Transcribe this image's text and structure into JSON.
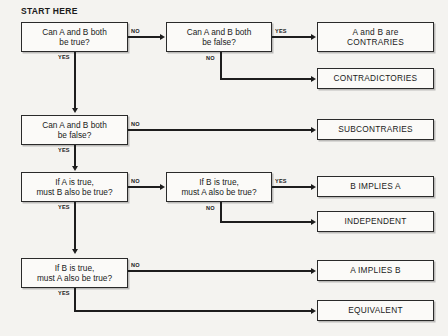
{
  "diagram": {
    "title_label": "START HERE",
    "nodes": [
      {
        "id": "q1",
        "kind": "decision",
        "lines": [
          "Can A and B both",
          "be true?"
        ]
      },
      {
        "id": "q2",
        "kind": "decision",
        "lines": [
          "Can A and B both",
          "be false?"
        ]
      },
      {
        "id": "r1",
        "kind": "result",
        "lines": [
          "A and B are",
          "CONTRARIES"
        ]
      },
      {
        "id": "r2",
        "kind": "result",
        "lines": [
          "CONTRADICTORIES"
        ]
      },
      {
        "id": "q3",
        "kind": "decision",
        "lines": [
          "Can A and B both",
          "be false?"
        ]
      },
      {
        "id": "r3",
        "kind": "result",
        "lines": [
          "SUBCONTRARIES"
        ]
      },
      {
        "id": "q4",
        "kind": "decision",
        "lines": [
          "If A is true,",
          "must B also be true?"
        ]
      },
      {
        "id": "q5",
        "kind": "decision",
        "lines": [
          "If B is true,",
          "must A also be true?"
        ]
      },
      {
        "id": "r4",
        "kind": "result",
        "lines": [
          "B IMPLIES A"
        ]
      },
      {
        "id": "r5",
        "kind": "result",
        "lines": [
          "INDEPENDENT"
        ]
      },
      {
        "id": "q6",
        "kind": "decision",
        "lines": [
          "If B is true,",
          "must A also be true?"
        ]
      },
      {
        "id": "r6",
        "kind": "result",
        "lines": [
          "A IMPLIES B"
        ]
      },
      {
        "id": "r7",
        "kind": "result",
        "lines": [
          "EQUIVALENT"
        ]
      }
    ],
    "edge_labels": {
      "q1_no": "NO",
      "q1_yes": "YES",
      "q2_yes": "YES",
      "q2_no": "NO",
      "q3_no": "NO",
      "q3_yes": "YES",
      "q4_no": "NO",
      "q4_yes": "YES",
      "q5_yes": "YES",
      "q5_no": "NO",
      "q6_no": "NO",
      "q6_yes": "YES"
    },
    "colors": {
      "background": "#f4f3f0",
      "box_fill": "#fbfaf8",
      "stroke": "#1d1d1d",
      "text": "#1a1a1a"
    }
  }
}
